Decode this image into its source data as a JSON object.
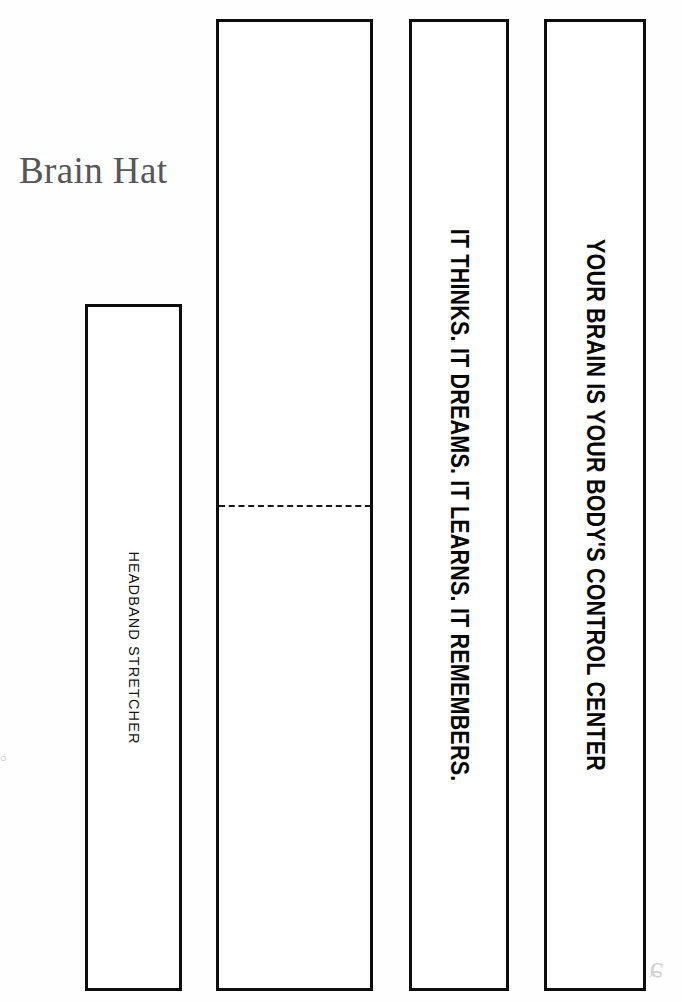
{
  "document": {
    "title": "Brain Hat",
    "title_color": "#55565a",
    "background_color": "#fefefe",
    "ink_color": "#0d0d0d"
  },
  "strips": [
    {
      "id": "headband-stretcher",
      "label": "HEADBAND STRETCHER",
      "orientation": "vertical-rotated-90",
      "has_fold_line": false
    },
    {
      "id": "blank-panel",
      "label": "",
      "orientation": "none",
      "has_fold_line": true,
      "fold_style": "dashed"
    },
    {
      "id": "slogan-thinks",
      "label": "IT THINKS. IT DREAMS. IT LEARNS. IT REMEMBERS.",
      "orientation": "vertical-rotated-90",
      "has_fold_line": false
    },
    {
      "id": "slogan-control-center",
      "label": "YOUR BRAIN IS YOUR BODY'S CONTROL CENTER",
      "orientation": "vertical-rotated-90",
      "has_fold_line": false
    }
  ],
  "artifacts": {
    "left_mark": "°",
    "corner_mark": "ɕ"
  }
}
